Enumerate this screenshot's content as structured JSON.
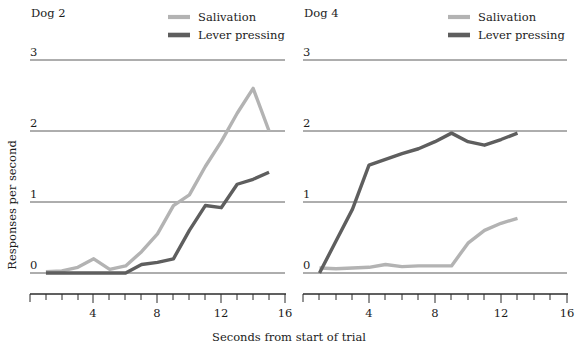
{
  "figure": {
    "ylabel": "Responses per second",
    "xlabel": "Seconds from start of trial",
    "legend": {
      "salivation_label": "Salivation",
      "lever_label": "Lever pressing",
      "salivation_color": "#b3b3b3",
      "lever_color": "#5e5e5e"
    },
    "y_ticks": [
      "0",
      "1",
      "2",
      "3"
    ],
    "x_ticks": [
      "4",
      "8",
      "12",
      "16"
    ]
  },
  "chart_data": [
    {
      "type": "line",
      "title": "Dog 2",
      "xlabel": "Seconds from start of trial",
      "ylabel": "Responses per second",
      "xlim": [
        0,
        16
      ],
      "ylim": [
        0,
        3
      ],
      "xticks": [
        4,
        8,
        12,
        16
      ],
      "yticks": [
        0,
        1,
        2,
        3
      ],
      "grid": true,
      "legend_position": "top-right",
      "series": [
        {
          "name": "Salivation",
          "color": "#b3b3b3",
          "x": [
            1,
            2,
            3,
            4,
            5,
            6,
            7,
            8,
            9,
            10,
            11,
            12,
            13,
            14,
            15
          ],
          "y": [
            0.02,
            0.03,
            0.08,
            0.2,
            0.05,
            0.1,
            0.3,
            0.55,
            0.95,
            1.1,
            1.5,
            1.85,
            2.25,
            2.6,
            2.0
          ]
        },
        {
          "name": "Lever pressing",
          "color": "#5e5e5e",
          "x": [
            1,
            2,
            3,
            4,
            5,
            6,
            7,
            8,
            9,
            10,
            11,
            12,
            13,
            14,
            15
          ],
          "y": [
            0.0,
            0.0,
            0.0,
            0.0,
            0.0,
            0.0,
            0.12,
            0.15,
            0.2,
            0.6,
            0.95,
            0.92,
            1.25,
            1.32,
            1.42
          ]
        }
      ]
    },
    {
      "type": "line",
      "title": "Dog 4",
      "xlabel": "Seconds from start of trial",
      "ylabel": "Responses per second",
      "xlim": [
        0,
        16
      ],
      "ylim": [
        0,
        3
      ],
      "xticks": [
        4,
        8,
        12,
        16
      ],
      "yticks": [
        0,
        1,
        2,
        3
      ],
      "grid": true,
      "legend_position": "top-right",
      "series": [
        {
          "name": "Salivation",
          "color": "#b3b3b3",
          "x": [
            1,
            2,
            3,
            4,
            5,
            6,
            7,
            8,
            9,
            10,
            11,
            12,
            13
          ],
          "y": [
            0.07,
            0.06,
            0.07,
            0.08,
            0.12,
            0.09,
            0.1,
            0.1,
            0.1,
            0.42,
            0.6,
            0.7,
            0.77
          ]
        },
        {
          "name": "Lever pressing",
          "color": "#5e5e5e",
          "x": [
            1,
            2,
            3,
            4,
            5,
            6,
            7,
            8,
            9,
            10,
            11,
            12,
            13
          ],
          "y": [
            0.0,
            0.45,
            0.9,
            1.52,
            1.6,
            1.68,
            1.75,
            1.85,
            1.97,
            1.85,
            1.8,
            1.88,
            1.97
          ]
        }
      ]
    }
  ]
}
